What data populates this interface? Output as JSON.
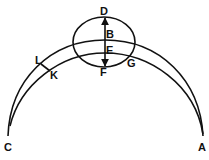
{
  "diagram": {
    "type": "geometric-arcs",
    "labels": {
      "D": "D",
      "B": "B",
      "E": "E",
      "F": "F",
      "G": "G",
      "L": "L",
      "K": "K",
      "C": "C",
      "A": "A"
    },
    "stroke_color": "#111111",
    "background": "#ffffff"
  }
}
